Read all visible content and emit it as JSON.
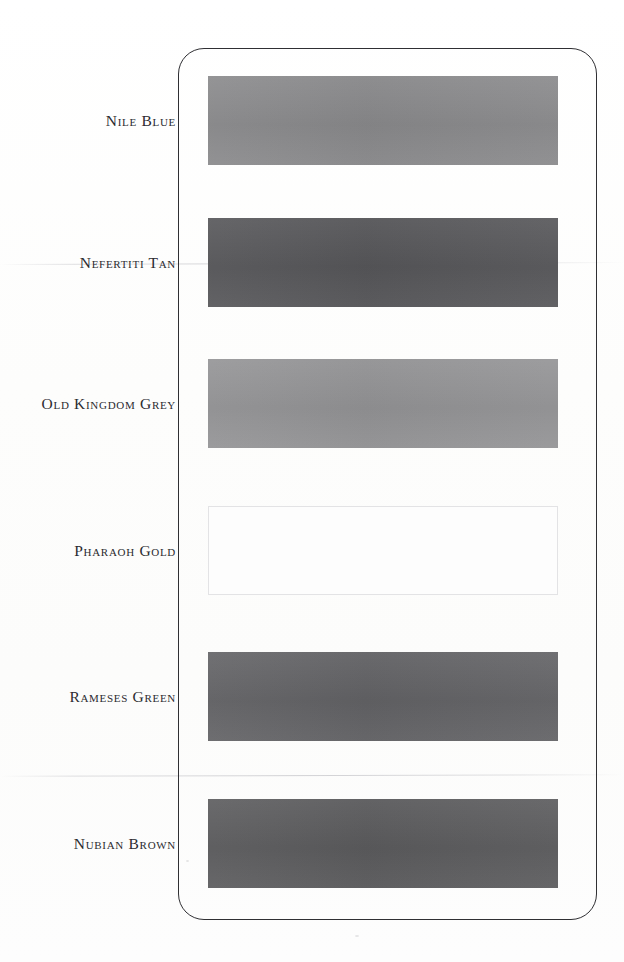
{
  "document": {
    "type": "colour-swatch-chart",
    "background_color": "#fdfdfd",
    "card": {
      "border_color": "#2f2f33",
      "corner_radius_px": 26
    }
  },
  "swatches": [
    {
      "label": "Nile Blue",
      "color": "#8a8a8c",
      "top": 76,
      "faded": false
    },
    {
      "label": "Nefertiti Tan",
      "color": "#57575a",
      "top": 218,
      "faded": false
    },
    {
      "label": "Old Kingdom Grey",
      "color": "#949496",
      "top": 359,
      "faded": false
    },
    {
      "label": "Pharaoh Gold",
      "color": "#fdfdfd",
      "top": 506,
      "faded": true
    },
    {
      "label": "Rameses Green",
      "color": "#636366",
      "top": 652,
      "faded": false
    },
    {
      "label": "Nubian Brown",
      "color": "#5c5c5e",
      "top": 799,
      "faded": false
    }
  ]
}
